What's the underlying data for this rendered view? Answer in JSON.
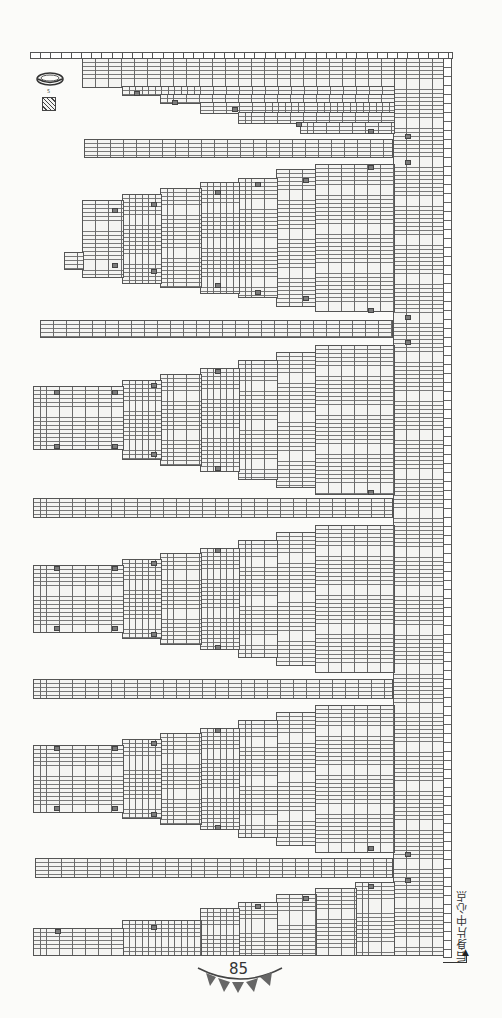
{
  "page": {
    "number": "85"
  },
  "label": {
    "center_point": "后身片中心点",
    "arrow": "▲"
  },
  "legend": {
    "symbol_1": "chain-ring-icon",
    "symbol_1_note": "5",
    "symbol_2": "hatched-square-icon"
  },
  "colors": {
    "grid_line": "#6a6a6a",
    "mark_fill": "#7c7c7c",
    "background": "#fbfbf9",
    "pennant": "#666666"
  },
  "chart_structure": {
    "type": "knitting-chart",
    "orientation": "rotated 90°",
    "bands": [
      {
        "kind": "gore",
        "index": 1
      },
      {
        "kind": "strip",
        "index": 1
      },
      {
        "kind": "gore",
        "index": 2
      },
      {
        "kind": "strip",
        "index": 2
      },
      {
        "kind": "gore",
        "index": 3
      },
      {
        "kind": "strip",
        "index": 3
      },
      {
        "kind": "gore",
        "index": 4
      },
      {
        "kind": "strip",
        "index": 4
      },
      {
        "kind": "gore",
        "index": 5
      },
      {
        "kind": "strip",
        "index": 5
      },
      {
        "kind": "gore",
        "index": 6
      }
    ]
  }
}
